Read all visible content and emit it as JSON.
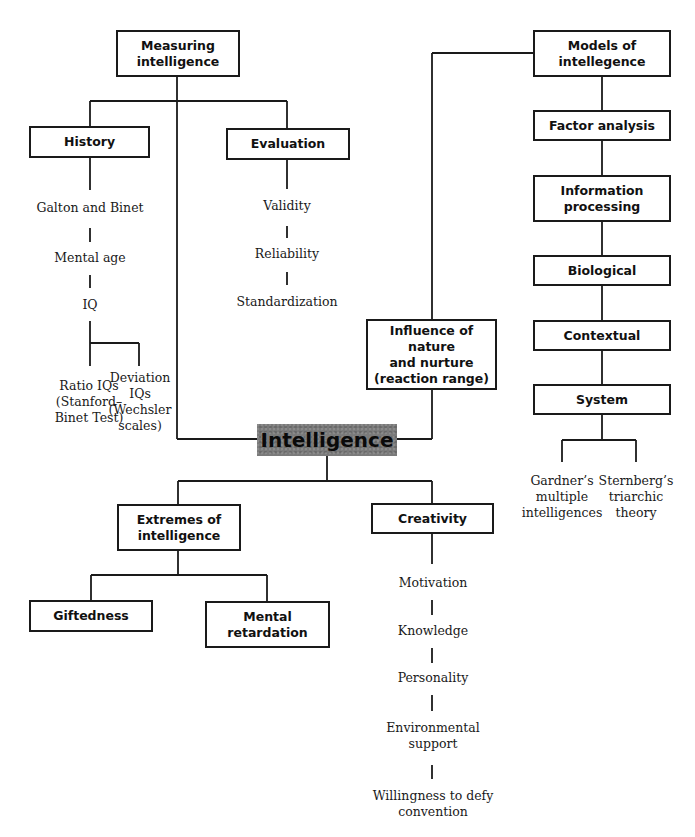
{
  "central": {
    "label": "Intelligence",
    "fill": "#7a7a7a"
  },
  "measuring": {
    "label": "Measuring\nintelligence",
    "history": {
      "label": "History",
      "items": [
        "Galton and Binet",
        "Mental age",
        "IQ"
      ],
      "iq_children": [
        "Ratio IQs\n(Stanford–\nBinet Test)",
        "Deviation\nIQs\n(Wechsler\nscales)"
      ]
    },
    "evaluation": {
      "label": "Evaluation",
      "items": [
        "Validity",
        "Reliability",
        "Standardization"
      ]
    }
  },
  "models": {
    "label": "Models of\nintellegence",
    "items": [
      "Factor analysis",
      "Information\nprocessing",
      "Biological",
      "Contextual",
      "System"
    ],
    "system_children": [
      "Gardner’s\nmultiple\nintelligences",
      "Sternberg’s\ntriarchic\ntheory"
    ]
  },
  "nature_nurture": {
    "label": "Influence of nature\nand nurture\n(reaction range)"
  },
  "extremes": {
    "label": "Extremes of\nintelligence",
    "children": [
      "Giftedness",
      "Mental\nretardation"
    ]
  },
  "creativity": {
    "label": "Creativity",
    "items": [
      "Motivation",
      "Knowledge",
      "Personality",
      "Environmental\nsupport",
      "Willingness to defy\nconvention"
    ]
  }
}
